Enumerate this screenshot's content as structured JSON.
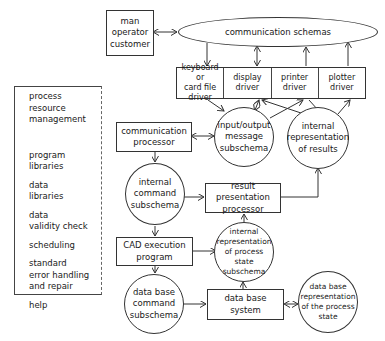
{
  "diagram": {
    "actor": {
      "lines": [
        "man",
        "operator",
        "customer"
      ]
    },
    "communication_schemas": {
      "label": "communication schemas"
    },
    "drivers": [
      {
        "lines": [
          "keyboard or",
          "card file",
          "driver"
        ]
      },
      {
        "lines": [
          "display",
          "driver"
        ]
      },
      {
        "lines": [
          "printer",
          "driver"
        ]
      },
      {
        "lines": [
          "plotter",
          "driver"
        ]
      }
    ],
    "communication_processor": {
      "lines": [
        "communication",
        "processor"
      ]
    },
    "io_message_subschema": {
      "lines": [
        "input/output",
        "message",
        "subschema"
      ]
    },
    "internal_results": {
      "lines": [
        "internal",
        "representation",
        "of results"
      ]
    },
    "internal_command_subschema": {
      "lines": [
        "internal",
        "command",
        "subschema"
      ]
    },
    "result_presentation_processor": {
      "lines": [
        "result presentation",
        "processor"
      ]
    },
    "cad_execution_program": {
      "lines": [
        "CAD execution",
        "program"
      ]
    },
    "internal_process_state": {
      "lines": [
        "internal",
        "representation",
        "of process state",
        "subschema"
      ]
    },
    "db_command_subschema": {
      "lines": [
        "data base",
        "command",
        "subschema"
      ]
    },
    "db_system": {
      "lines": [
        "data base",
        "system"
      ]
    },
    "db_process_state": {
      "lines": [
        "data base",
        "representation",
        "of the process",
        "state"
      ]
    },
    "left_panel": {
      "items": [
        "process\nresource\nmanagement",
        "program\nlibraries",
        "data\nlibraries",
        "data\nvalidity check",
        "scheduling",
        "standard\nerror handling\nand repair",
        "help"
      ]
    }
  }
}
